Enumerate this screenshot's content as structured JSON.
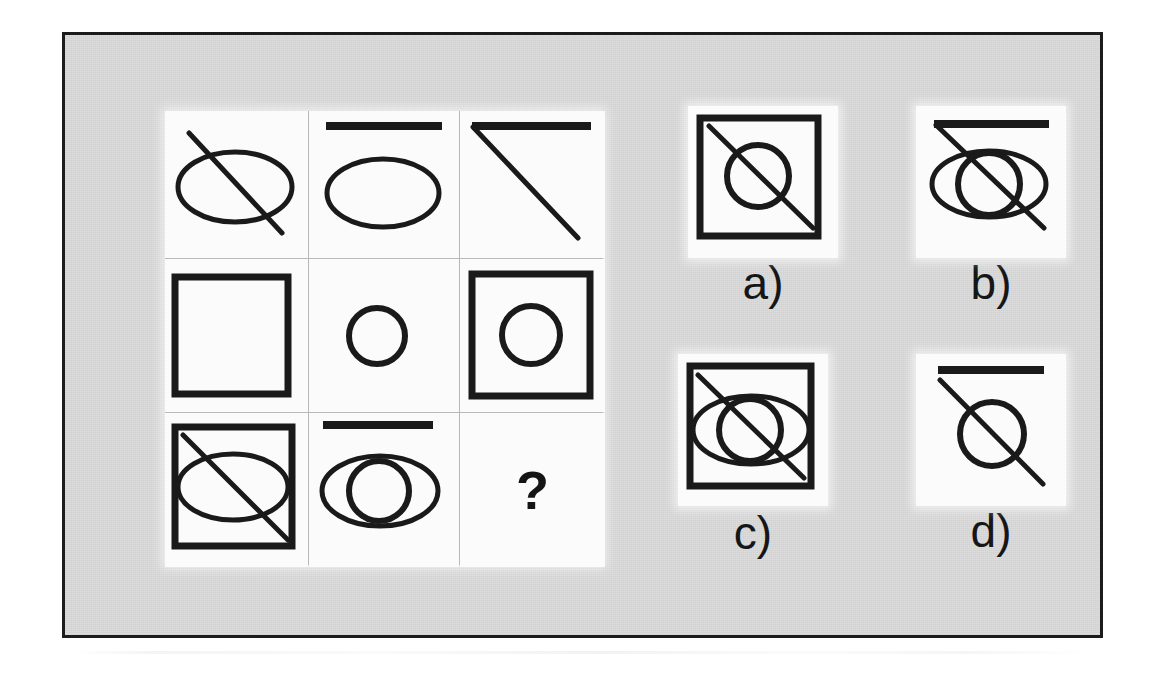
{
  "puzzle": {
    "type": "matrix-reasoning",
    "title": "Figural matrix puzzle",
    "background_color": "#dcdcdc",
    "cell_color": "#fbfbfb",
    "ink_color": "#1a1a1a",
    "frame_color": "#1c1c1c",
    "matrix": {
      "rows": 3,
      "columns": 3,
      "cells": [
        {
          "id": "r1c1",
          "position": "row 1, column 1",
          "description": "ellipse crossed by a diagonal line",
          "elements": [
            "ellipse",
            "diagonal-line"
          ]
        },
        {
          "id": "r1c2",
          "position": "row 1, column 2",
          "description": "horizontal bar above an ellipse",
          "elements": [
            "horizontal-bar",
            "ellipse"
          ]
        },
        {
          "id": "r1c3",
          "position": "row 1, column 3",
          "description": "horizontal bar with a diagonal line",
          "elements": [
            "horizontal-bar",
            "diagonal-line"
          ]
        },
        {
          "id": "r2c1",
          "position": "row 2, column 1",
          "description": "empty square",
          "elements": [
            "square"
          ]
        },
        {
          "id": "r2c2",
          "position": "row 2, column 2",
          "description": "small circle",
          "elements": [
            "circle"
          ]
        },
        {
          "id": "r2c3",
          "position": "row 2, column 3",
          "description": "square containing a circle",
          "elements": [
            "square",
            "circle"
          ]
        },
        {
          "id": "r3c1",
          "position": "row 3, column 1",
          "description": "square containing an ellipse crossed by a diagonal line",
          "elements": [
            "square",
            "ellipse",
            "diagonal-line"
          ]
        },
        {
          "id": "r3c2",
          "position": "row 3, column 2",
          "description": "horizontal bar above an ellipse overlapping a circle",
          "elements": [
            "horizontal-bar",
            "ellipse",
            "circle"
          ]
        },
        {
          "id": "r3c3",
          "position": "row 3, column 3",
          "description": "missing element",
          "elements": [
            "question-mark"
          ],
          "text": "?"
        }
      ]
    },
    "options": [
      {
        "id": "a",
        "label": "a)",
        "description": "square containing a circle crossed by a diagonal line",
        "elements": [
          "square",
          "circle",
          "diagonal-line"
        ]
      },
      {
        "id": "b",
        "label": "b)",
        "description": "horizontal bar above an ellipse and circle crossed by a diagonal line",
        "elements": [
          "horizontal-bar",
          "ellipse",
          "circle",
          "diagonal-line"
        ]
      },
      {
        "id": "c",
        "label": "c)",
        "description": "square containing an ellipse and circle crossed by a diagonal line",
        "elements": [
          "square",
          "ellipse",
          "circle",
          "diagonal-line"
        ]
      },
      {
        "id": "d",
        "label": "d)",
        "description": "horizontal bar above a circle crossed by a diagonal line",
        "elements": [
          "horizontal-bar",
          "circle",
          "diagonal-line"
        ]
      }
    ]
  }
}
